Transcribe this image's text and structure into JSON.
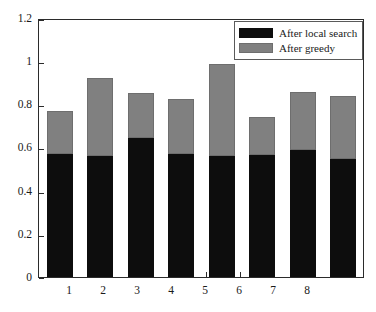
{
  "chart_data": {
    "type": "bar",
    "stacked": true,
    "title": "",
    "xlabel": "",
    "ylabel": "",
    "categories": [
      "1",
      "2",
      "3",
      "4",
      "5",
      "6",
      "7",
      "8"
    ],
    "series": [
      {
        "name": "After local search",
        "color": "#0d0d0d",
        "values": [
          0.575,
          0.565,
          0.649,
          0.575,
          0.565,
          0.57,
          0.593,
          0.551
        ]
      },
      {
        "name": "After greedy",
        "color": "#808080",
        "values": [
          0.199,
          0.362,
          0.208,
          0.254,
          0.431,
          0.176,
          0.273,
          0.292
        ]
      }
    ],
    "stack_totals": [
      0.774,
      0.927,
      0.857,
      0.829,
      0.996,
      0.746,
      0.866,
      0.843
    ],
    "ylim": [
      0,
      1.2
    ],
    "yticks": [
      0,
      0.2,
      0.4,
      0.6,
      0.8,
      1,
      1.2
    ],
    "ytick_labels": [
      "0",
      "0.2",
      "0.4",
      "0.6",
      "0.8",
      "1",
      "1.2"
    ],
    "xtick_labels": [
      "1",
      "2",
      "3",
      "4",
      "5",
      "6",
      "7",
      "8"
    ],
    "grid": false,
    "legend_position": "top-right",
    "legend": [
      "After local search",
      "After greedy"
    ]
  },
  "legend": {
    "items": [
      {
        "label": "After local search",
        "swatch": "black"
      },
      {
        "label": "After greedy",
        "swatch": "gray"
      }
    ]
  },
  "axes": {
    "y_labels": [
      "1.2",
      "1",
      "0.8",
      "0.6",
      "0.4",
      "0.2",
      "0"
    ],
    "x_labels": [
      "1",
      "2",
      "3",
      "4",
      "5",
      "6",
      "7",
      "8"
    ]
  },
  "colors": {
    "local_search": "#0d0d0d",
    "greedy": "#808080",
    "axis": "#2b2b2b",
    "background": "#ffffff"
  }
}
